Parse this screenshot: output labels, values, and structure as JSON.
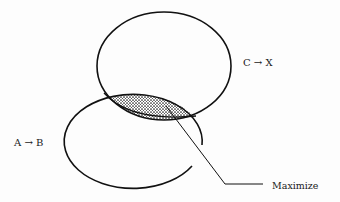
{
  "diagram": {
    "type": "venn-diagram",
    "sets": [
      {
        "id": "upper",
        "label": "C → X",
        "shape": "ellipse",
        "center": [
          164,
          66
        ],
        "rx": 67,
        "ry": 54,
        "closed": true
      },
      {
        "id": "lower",
        "label": "A → B",
        "shape": "ellipse-arc",
        "center": [
          136,
          142
        ],
        "rx": 69,
        "ry": 47,
        "closed": false,
        "gap": "right side, between the two arc ends"
      }
    ],
    "intersection": {
      "fill": "stippled",
      "annotation": "Maximize"
    },
    "labels": {
      "upper_set": "C → X",
      "lower_set": "A → B",
      "intersection": "Maximize"
    },
    "colors": {
      "stroke": "#111111",
      "background": "#fdfdfd",
      "stipple": "#222222"
    }
  }
}
